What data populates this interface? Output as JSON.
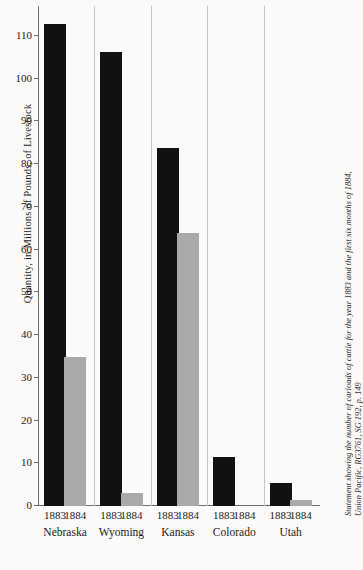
{
  "chart_data": {
    "type": "bar",
    "title": "",
    "xlabel": "",
    "ylabel": "Quantity, in Millions of Pounds, of Livestock",
    "ylim": [
      0,
      117
    ],
    "yticks": [
      0,
      10,
      20,
      30,
      40,
      50,
      60,
      70,
      80,
      90,
      100,
      110
    ],
    "grid": false,
    "legend": "none",
    "categories": [
      "Nebraska",
      "Wyoming",
      "Kansas",
      "Colorado",
      "Utah"
    ],
    "group_years": [
      "1883",
      "1884"
    ],
    "series": [
      {
        "name": "1883",
        "color": "#111111",
        "values": [
          112.7,
          106.3,
          83.8,
          11.4,
          5.5
        ]
      },
      {
        "name": "1884",
        "color": "#a9a9a9",
        "values": [
          34.8,
          3.0,
          64.0,
          0,
          1.5
        ]
      }
    ]
  },
  "axis": {
    "y_title": "Quantity, in Millions of Pounds, of Livestock",
    "tick_labels": [
      "0",
      "10",
      "20",
      "30",
      "40",
      "50",
      "60",
      "70",
      "80",
      "90",
      "100",
      "110"
    ]
  },
  "caption": {
    "line1": "Statement showing the number of carloads of cattle for the year 1883 and the first six months of 1884,",
    "line2": "Union Pacific, RG3761, SG 192, p. 149"
  }
}
